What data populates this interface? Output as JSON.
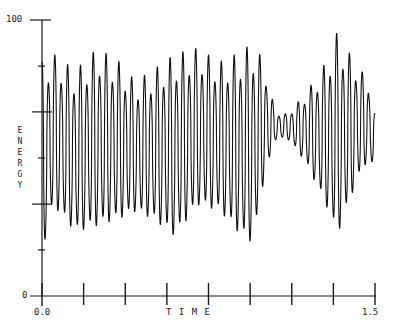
{
  "chart_data": {
    "type": "line",
    "title": "",
    "xlabel": "T I M E",
    "ylabel": "ENERGY",
    "xlim": [
      0.0,
      1.5
    ],
    "ylim": [
      0,
      100
    ],
    "x_tick_labels": [
      "0.0",
      "1.5"
    ],
    "y_tick_labels": [
      "0",
      "100"
    ],
    "x_tick_count": 9,
    "y_minor_ticks": [
      16.7,
      33.3,
      50,
      66.7,
      83.3
    ],
    "grid": false,
    "legend": null,
    "series": [
      {
        "name": "energy",
        "description": "Rapid oscillation (~52 cycles) around ~60 with amplitude modulation; quiet low-amplitude stretch near t≈1.05-1.15; largest swings near t≈1.35",
        "cycles": 52,
        "envelope_t": [
          0.0,
          0.05,
          0.15,
          0.25,
          0.35,
          0.42,
          0.5,
          0.6,
          0.7,
          0.8,
          0.88,
          0.95,
          1.0,
          1.05,
          1.1,
          1.15,
          1.2,
          1.28,
          1.33,
          1.37,
          1.42,
          1.47,
          1.5
        ],
        "envelope_max": [
          85,
          88,
          82,
          90,
          85,
          78,
          82,
          88,
          90,
          85,
          88,
          92,
          85,
          67,
          66,
          70,
          75,
          85,
          96,
          90,
          84,
          78,
          66
        ],
        "envelope_min": [
          12,
          30,
          20,
          22,
          25,
          28,
          25,
          18,
          30,
          28,
          20,
          15,
          40,
          56,
          57,
          52,
          45,
          30,
          18,
          28,
          40,
          48,
          45
        ]
      }
    ]
  },
  "axes": {
    "y_top_label": "100",
    "y_bottom_label": "0",
    "x_left_label": "0.0",
    "x_right_label": "1.5",
    "x_title": "T I M E",
    "y_title_letters": [
      "E",
      "N",
      "E",
      "R",
      "G",
      "Y"
    ]
  }
}
